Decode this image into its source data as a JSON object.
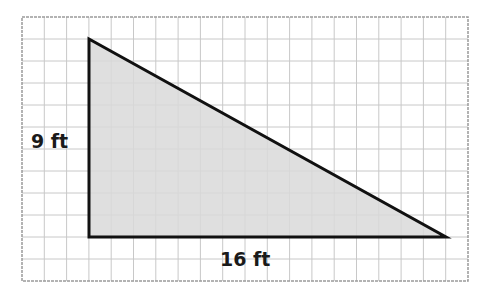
{
  "figure": {
    "type": "right-triangle-on-grid",
    "grid": {
      "left": 22,
      "top": 17,
      "right": 468,
      "bottom": 281,
      "cell_size": 22.2,
      "line_color": "#c8c8c8",
      "border_color": "#9a9a9a"
    },
    "triangle": {
      "vertices": [
        [
          89,
          39
        ],
        [
          89,
          237
        ],
        [
          446,
          237
        ]
      ],
      "fill": "#d9d9d9",
      "stroke": "#111111",
      "stroke_width": 3
    },
    "labels": {
      "height": "9 ft",
      "base": "16 ft"
    }
  }
}
